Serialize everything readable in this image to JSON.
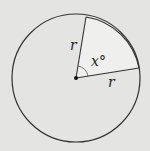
{
  "diagram": {
    "type": "circle-sector",
    "background": "#e4e4e2",
    "sector_fill": "#efefed",
    "stroke": "#333333",
    "center_label": "",
    "radius_label_1": "r",
    "radius_label_2": "r",
    "angle_label": "x°"
  }
}
